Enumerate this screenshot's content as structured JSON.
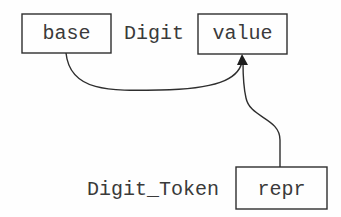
{
  "diagram": {
    "colors": {
      "background": "#fefefe",
      "stroke": "#2e2e2e",
      "text": "#3a3a3a"
    },
    "classes": [
      {
        "name": "Digit",
        "attributes": [
          {
            "label": "base"
          },
          {
            "label": "value"
          }
        ]
      },
      {
        "name": "Digit_Token",
        "attributes": [
          {
            "label": "repr"
          }
        ]
      }
    ],
    "edges": [
      {
        "from": "base",
        "to": "value",
        "arrow": "filled-triangle"
      },
      {
        "from": "repr",
        "to": "value",
        "arrow": "filled-triangle"
      }
    ]
  }
}
